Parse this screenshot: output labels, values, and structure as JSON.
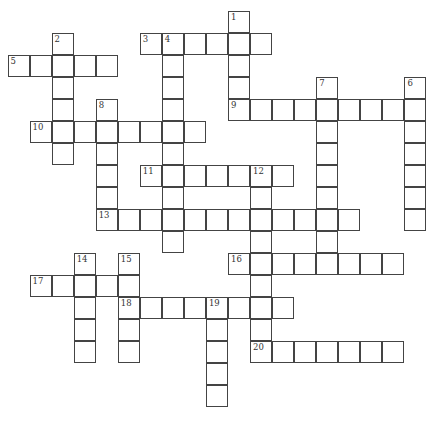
{
  "puzzle": {
    "grid": {
      "origin_x": 8,
      "origin_y": 11,
      "cell_size": 22.05,
      "border_color": "#444444",
      "background": "#ffffff"
    },
    "words": [
      {
        "number": 1,
        "direction": "down",
        "row": 0,
        "col": 10,
        "length": 5
      },
      {
        "number": 2,
        "direction": "down",
        "row": 1,
        "col": 2,
        "length": 6
      },
      {
        "number": 3,
        "direction": "across",
        "row": 1,
        "col": 6,
        "length": 6
      },
      {
        "number": 4,
        "direction": "down",
        "row": 1,
        "col": 7,
        "length": 10
      },
      {
        "number": 5,
        "direction": "across",
        "row": 2,
        "col": 0,
        "length": 5
      },
      {
        "number": 6,
        "direction": "down",
        "row": 3,
        "col": 18,
        "length": 7
      },
      {
        "number": 7,
        "direction": "down",
        "row": 3,
        "col": 14,
        "length": 9
      },
      {
        "number": 8,
        "direction": "down",
        "row": 4,
        "col": 4,
        "length": 5
      },
      {
        "number": 9,
        "direction": "across",
        "row": 4,
        "col": 10,
        "length": 9
      },
      {
        "number": 10,
        "direction": "across",
        "row": 5,
        "col": 1,
        "length": 8
      },
      {
        "number": 11,
        "direction": "across",
        "row": 7,
        "col": 6,
        "length": 7
      },
      {
        "number": 12,
        "direction": "down",
        "row": 7,
        "col": 11,
        "length": 8
      },
      {
        "number": 13,
        "direction": "across",
        "row": 9,
        "col": 4,
        "length": 12
      },
      {
        "number": 14,
        "direction": "down",
        "row": 11,
        "col": 3,
        "length": 5
      },
      {
        "number": 15,
        "direction": "down",
        "row": 11,
        "col": 5,
        "length": 5
      },
      {
        "number": 16,
        "direction": "across",
        "row": 11,
        "col": 10,
        "length": 8
      },
      {
        "number": 17,
        "direction": "across",
        "row": 12,
        "col": 1,
        "length": 5
      },
      {
        "number": 18,
        "direction": "across",
        "row": 13,
        "col": 5,
        "length": 8
      },
      {
        "number": 19,
        "direction": "down",
        "row": 13,
        "col": 9,
        "length": 5
      },
      {
        "number": 20,
        "direction": "across",
        "row": 15,
        "col": 11,
        "length": 7
      }
    ]
  }
}
